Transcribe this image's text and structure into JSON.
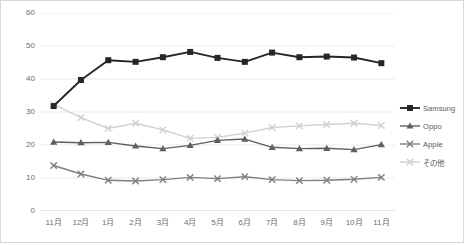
{
  "chart_data": {
    "type": "line",
    "title": "",
    "xlabel": "",
    "ylabel": "",
    "ylim": [
      0,
      60
    ],
    "ytick_step": 10,
    "grid": true,
    "legend_position": "right",
    "categories": [
      "11月",
      "12月",
      "1月",
      "2月",
      "3月",
      "4月",
      "5月",
      "6月",
      "7月",
      "8月",
      "9月",
      "10月",
      "11月"
    ],
    "yticks": [
      "0",
      "10",
      "20",
      "30",
      "40",
      "50",
      "60"
    ],
    "series": [
      {
        "name": "Samsung",
        "color": "#262626",
        "marker": "square",
        "values": [
          31.8,
          39.7,
          45.7,
          45.2,
          46.6,
          48.2,
          46.4,
          45.2,
          48.0,
          46.6,
          46.8,
          46.5,
          44.8
        ]
      },
      {
        "name": "Oppo",
        "color": "#5f5f5f",
        "marker": "triangle",
        "values": [
          20.9,
          20.7,
          20.8,
          19.7,
          18.9,
          19.9,
          21.4,
          21.8,
          19.3,
          18.9,
          19.0,
          18.6,
          20.1
        ]
      },
      {
        "name": "Apple",
        "color": "#7f7f7f",
        "marker": "x",
        "values": [
          13.8,
          11.2,
          9.3,
          9.1,
          9.5,
          10.2,
          9.8,
          10.4,
          9.5,
          9.2,
          9.3,
          9.6,
          10.2
        ]
      },
      {
        "name": "その他",
        "color": "#d0d0d0",
        "marker": "x",
        "values": [
          32.3,
          28.3,
          25.0,
          26.6,
          24.6,
          22.0,
          22.3,
          23.6,
          25.3,
          25.8,
          26.2,
          26.6,
          25.9
        ]
      }
    ]
  },
  "legend": {
    "items": [
      {
        "label": "Samsung"
      },
      {
        "label": "Oppo"
      },
      {
        "label": "Apple"
      },
      {
        "label": "その他"
      }
    ]
  }
}
